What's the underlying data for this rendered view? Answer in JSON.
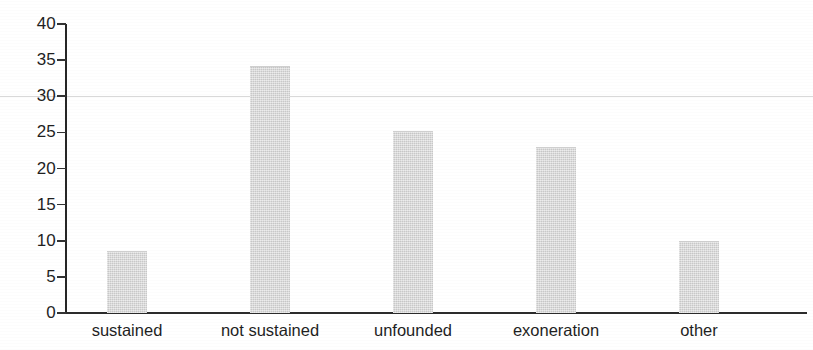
{
  "chart_data": {
    "type": "bar",
    "title": "",
    "subtitle": "",
    "xlabel": "",
    "ylabel": "",
    "categories": [
      "sustained",
      "not sustained",
      "unfounded",
      "exoneration",
      "other"
    ],
    "values": [
      8.4,
      34,
      25,
      22.8,
      9.8
    ],
    "ylim": [
      0,
      40
    ],
    "yticks": [
      0,
      5,
      10,
      15,
      20,
      25,
      30,
      35,
      40
    ],
    "ytick_labels": [
      "0",
      "5",
      "10",
      "15",
      "20",
      "25",
      "30",
      "35",
      "40"
    ],
    "grid": false,
    "legend": "none",
    "bar_color": "#d6d6d6",
    "axis_color": "#2b2b2b",
    "text_color": "#1f1f1f"
  }
}
